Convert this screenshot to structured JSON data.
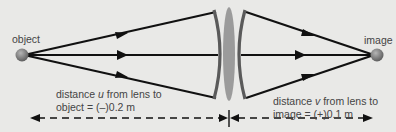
{
  "labels": {
    "object": "object",
    "image": "image",
    "u_line1_pre": "distance ",
    "u_var": "u",
    "u_line1_post": " from lens to",
    "u_line2": "object = (–)0.2 m",
    "v_line1_pre": "distance ",
    "v_var": "v",
    "v_line1_post": " from lens to",
    "v_line2": "image = (+)0.1 m"
  },
  "values": {
    "object_distance_m": -0.2,
    "image_distance_m": 0.1
  },
  "colors": {
    "background": "#e9e9e7",
    "rays": "#111111",
    "lens_edges": "#5a5a5a",
    "lens_center": "#9a9a9a",
    "points": "#7a7a7a",
    "text": "#444444"
  }
}
